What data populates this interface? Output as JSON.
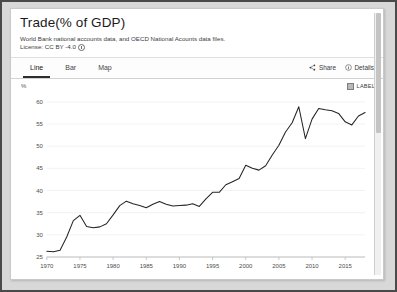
{
  "card": {
    "title": "Trade(% of GDP)",
    "source": "World Bank national accounts data, and OECD National Acounts data files.",
    "license": "License: CC BY -4.0",
    "license_icon": "info-circle-icon"
  },
  "tabs": [
    {
      "label": "Line",
      "active": true
    },
    {
      "label": "Bar",
      "active": false
    },
    {
      "label": "Map",
      "active": false
    }
  ],
  "actions": [
    {
      "label": "Share",
      "icon": "share-icon"
    },
    {
      "label": "Details",
      "icon": "info-circle-icon"
    }
  ],
  "legend": {
    "label": "LABEL",
    "swatch_icon": "legend-square-icon",
    "swatch_color": "#b8b8b8"
  },
  "chart_data": {
    "type": "line",
    "title": "Trade(% of GDP)",
    "xlabel": "",
    "ylabel": "%",
    "yunit": "%",
    "grid": true,
    "legend_position": "top-right",
    "line_color": "#242424",
    "xlim": [
      1970,
      2018
    ],
    "ylim": [
      25,
      62
    ],
    "x_ticks": [
      1970,
      1975,
      1980,
      1985,
      1990,
      1995,
      2000,
      2005,
      2010,
      2015
    ],
    "y_ticks": [
      25,
      30,
      35,
      40,
      45,
      50,
      55,
      60
    ],
    "series": [
      {
        "name": "LABEL",
        "x": [
          1970,
          1971,
          1972,
          1973,
          1974,
          1975,
          1976,
          1977,
          1978,
          1979,
          1980,
          1981,
          1982,
          1983,
          1984,
          1985,
          1986,
          1987,
          1988,
          1989,
          1990,
          1991,
          1992,
          1993,
          1994,
          1995,
          1996,
          1997,
          1998,
          1999,
          2000,
          2001,
          2002,
          2003,
          2004,
          2005,
          2006,
          2007,
          2008,
          2009,
          2010,
          2011,
          2012,
          2013,
          2014,
          2015,
          2016,
          2017,
          2018
        ],
        "values": [
          26.3,
          26.2,
          26.5,
          29.5,
          33.2,
          34.4,
          31.9,
          31.6,
          31.8,
          32.5,
          34.5,
          36.6,
          37.6,
          37.0,
          36.6,
          36.1,
          36.9,
          37.5,
          36.9,
          36.5,
          36.6,
          36.7,
          37.0,
          36.4,
          38.1,
          39.6,
          39.6,
          41.3,
          42.0,
          42.7,
          45.7,
          45.0,
          44.6,
          45.6,
          48.0,
          50.2,
          53.2,
          55.3,
          58.9,
          51.7,
          56.1,
          58.5,
          58.2,
          58.0,
          57.4,
          55.5,
          54.8,
          56.8,
          57.6
        ]
      }
    ]
  }
}
